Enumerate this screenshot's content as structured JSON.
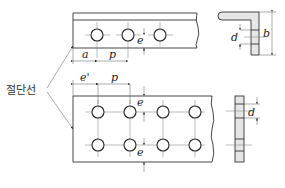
{
  "diagram": {
    "callout_label": "절단선",
    "top_plate": {
      "holes_count": 3,
      "dimensions": {
        "edge_distance": "a",
        "pitch": "p",
        "edge": "e"
      }
    },
    "top_section": {
      "dimensions": {
        "hole_diameter": "d",
        "leg_width": "b"
      }
    },
    "bottom_plate": {
      "holes_rows": 2,
      "holes_per_row": 4,
      "dimensions": {
        "edge_distance": "e'",
        "pitch": "p",
        "edge_top": "e",
        "edge_bottom": "e"
      }
    },
    "bottom_section": {
      "dimensions": {
        "hole_diameter": "d"
      }
    }
  }
}
